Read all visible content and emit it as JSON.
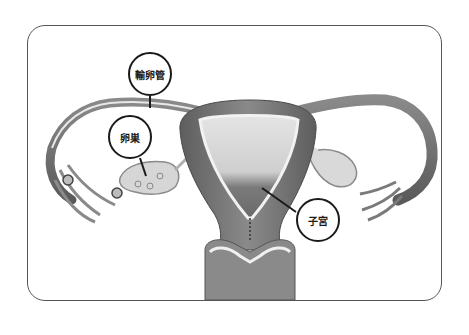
{
  "diagram": {
    "labels": [
      {
        "id": "fallopian-tube",
        "text": "輸卵管",
        "cx": 150,
        "cy": 74
      },
      {
        "id": "ovary",
        "text": "卵巣",
        "cx": 130,
        "cy": 137
      },
      {
        "id": "uterus",
        "text": "子宮",
        "cx": 318,
        "cy": 220
      }
    ],
    "colors": {
      "frame": "#555555",
      "label_ring": "#1a1a1a",
      "tissue_dark": "#6e6e6e",
      "tissue_mid": "#9a9a9a",
      "tissue_light": "#d8d8d8"
    }
  }
}
